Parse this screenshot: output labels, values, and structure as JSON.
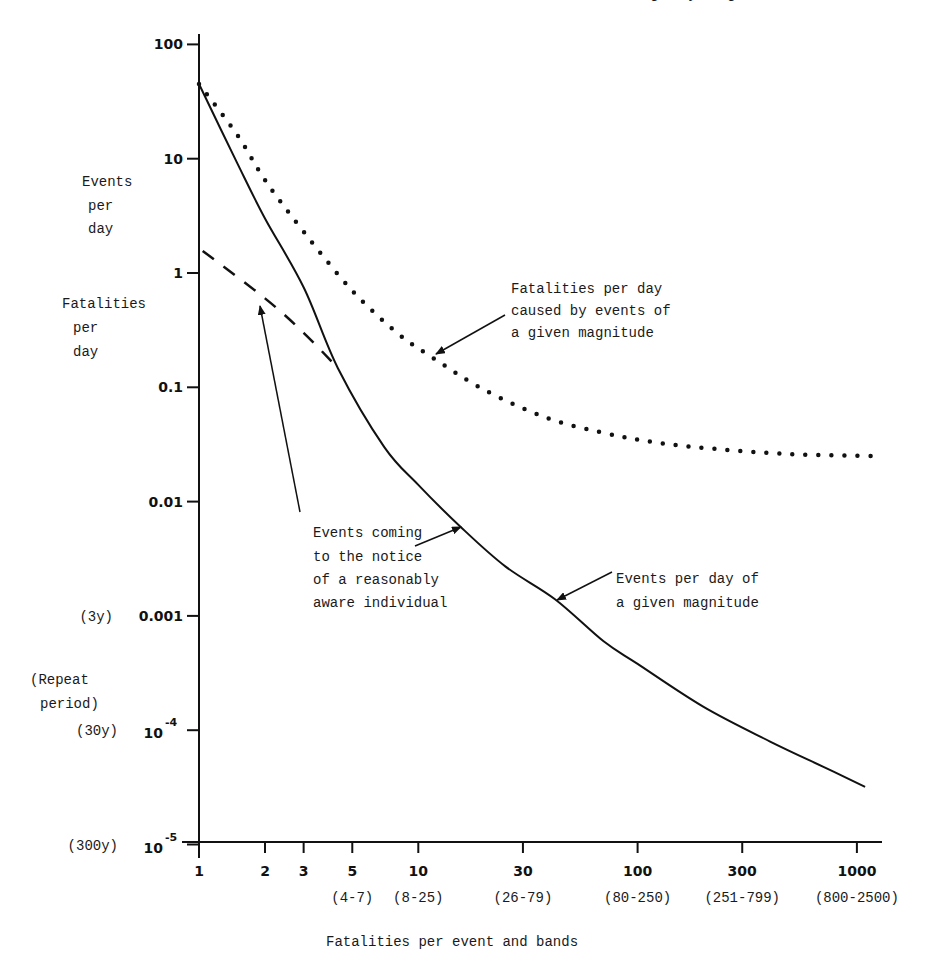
{
  "header": {
    "running_head_fragment": "…g … y … g"
  },
  "chart_data": {
    "type": "line",
    "title": "",
    "xlabel": "Fatalities per event and bands",
    "ylabel": "Events per day / Fatalities per day",
    "ylabel_lines": [
      "Events",
      "per",
      "day",
      "Fatalities",
      "per",
      "day"
    ],
    "secondary_ylabel_lines": [
      "(Repeat",
      "period)"
    ],
    "x_scale": "log",
    "y_scale": "log",
    "xlim": [
      1,
      1200
    ],
    "ylim": [
      1e-05,
      100
    ],
    "grid": false,
    "x_ticks": [
      {
        "value": 1,
        "label": "1",
        "band": ""
      },
      {
        "value": 2,
        "label": "2",
        "band": ""
      },
      {
        "value": 3,
        "label": "3",
        "band": ""
      },
      {
        "value": 5,
        "label": "5",
        "band": "(4-7)"
      },
      {
        "value": 10,
        "label": "10",
        "band": "(8-25)"
      },
      {
        "value": 30,
        "label": "30",
        "band": "(26-79)"
      },
      {
        "value": 100,
        "label": "100",
        "band": "(80-250)"
      },
      {
        "value": 300,
        "label": "300",
        "band": "(251-799)"
      },
      {
        "value": 1000,
        "label": "1000",
        "band": "(800-2500)"
      }
    ],
    "y_ticks": [
      {
        "value": 100,
        "label": "100",
        "repeat_period": ""
      },
      {
        "value": 10,
        "label": "10",
        "repeat_period": ""
      },
      {
        "value": 1,
        "label": "1",
        "repeat_period": ""
      },
      {
        "value": 0.1,
        "label": "0.1",
        "repeat_period": ""
      },
      {
        "value": 0.01,
        "label": "0.01",
        "repeat_period": ""
      },
      {
        "value": 0.001,
        "label": "0.001",
        "repeat_period": "(3y)"
      },
      {
        "value": 0.0001,
        "label": "10",
        "exp": "-4",
        "repeat_period": "(30y)"
      },
      {
        "value": 1e-05,
        "label": "10",
        "exp": "-5",
        "repeat_period": "(300y)"
      }
    ],
    "series": [
      {
        "name": "Events per day of a given magnitude",
        "style": "solid",
        "x": [
          1,
          1.5,
          2,
          3,
          4.3,
          7,
          10,
          15.6,
          25,
          42,
          70,
          100,
          200,
          400,
          700,
          1090
        ],
        "values": [
          45,
          9,
          3.0,
          0.75,
          0.147,
          0.03,
          0.014,
          0.006,
          0.0027,
          0.0014,
          0.0006,
          0.00038,
          0.00016,
          8e-05,
          4.8e-05,
          3.2e-05
        ]
      },
      {
        "name": "Fatalities per day caused by events of a given magnitude",
        "style": "dotted",
        "x": [
          1,
          1.5,
          2,
          3,
          5,
          8,
          11.7,
          20,
          38.5,
          70,
          120,
          220,
          500,
          1200
        ],
        "values": [
          45,
          16,
          6.5,
          2.3,
          0.7,
          0.3,
          0.18,
          0.095,
          0.054,
          0.04,
          0.033,
          0.029,
          0.026,
          0.025
        ]
      },
      {
        "name": "Events coming to the notice of a reasonably aware individual",
        "style": "dashed",
        "x": [
          1.04,
          2,
          3,
          4.3
        ],
        "values": [
          1.56,
          0.6,
          0.3,
          0.147
        ]
      }
    ],
    "annotations": [
      {
        "text_lines": [
          "Fatalities per day",
          "caused by events of",
          "a given magnitude"
        ],
        "points_to_series": 1
      },
      {
        "text_lines": [
          "Events coming",
          "to the notice",
          "of a reasonably",
          "aware individual"
        ],
        "points_to_series": [
          2,
          0
        ]
      },
      {
        "text_lines": [
          "Events per day of",
          "a given magnitude"
        ],
        "points_to_series": 0
      }
    ],
    "colors": {
      "ink": "#111111",
      "background": "#ffffff"
    }
  }
}
